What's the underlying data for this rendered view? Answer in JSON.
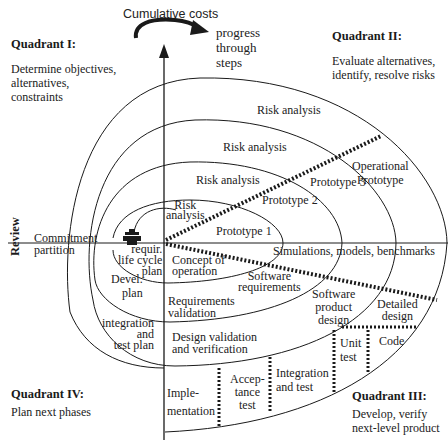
{
  "diagram": {
    "type": "spiral-model",
    "axes": {
      "vertical_label": "Cumulative costs",
      "horizontal_label": "Review",
      "progress_label": "progress\nthrough\nsteps"
    },
    "quadrants": [
      {
        "id": "I",
        "title": "Quadrant I:",
        "description": "Determine objectives,\nalternatives,\nconstraints"
      },
      {
        "id": "II",
        "title": "Quadrant II:",
        "description": "Evaluate alternatives,\nidentify, resolve risks"
      },
      {
        "id": "III",
        "title": "Quadrant III:",
        "description": "Develop, verify\nnext-level product"
      },
      {
        "id": "IV",
        "title": "Quadrant IV:",
        "description": "Plan next phases"
      }
    ],
    "labels": {
      "risk_analysis_1": "Risk\nanalysis",
      "risk_analysis_2": "Risk analysis",
      "risk_analysis_3": "Risk analysis",
      "risk_analysis_4": "Risk analysis",
      "prototype_1": "Prototype 1",
      "prototype_2": "Prototype 2",
      "prototype_3": "Prototype 3",
      "operational_prototype": "Operational\nPrototype",
      "commitment_partition": "Commitment\npartition",
      "requirements_plan": "requir.\nlife cycle\nplan",
      "devel_plan": "Devel.\nplan",
      "integration_test_plan": "integration\nand\ntest plan",
      "concept_of_operation": "Concept of\noperation",
      "simulations": "Simulations, models, benchmarks",
      "software_requirements": "Software\nrequirements",
      "requirements_validation": "Requirements\nvalidation",
      "software_product_design": "Software\nproduct\ndesign",
      "design_validation": "Design validation\nand verification",
      "detailed_design": "Detailed\ndesign",
      "code": "Code",
      "unit_test": "Unit\ntest",
      "integration_and_test": "Integration\nand test",
      "acceptance_test": "Accep-\ntance\ntest",
      "implementation": "Imple-\nmentation"
    },
    "colors": {
      "line": "#1a1a1a",
      "background": "#ffffff"
    }
  }
}
